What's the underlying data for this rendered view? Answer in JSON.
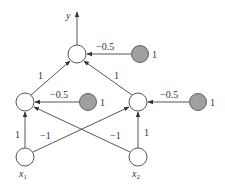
{
  "diagram": {
    "output_label": "y",
    "colors": {
      "node_fill": "#ffffff",
      "bias_fill": "#a0a0a0",
      "stroke": "#444444"
    },
    "nodes": {
      "output": {
        "x": 77,
        "y": 54
      },
      "hidden_left": {
        "x": 25,
        "y": 102
      },
      "hidden_right": {
        "x": 138,
        "y": 102
      },
      "input_x1": {
        "x": 25,
        "y": 157,
        "label": "x",
        "sub": "1"
      },
      "input_x2": {
        "x": 138,
        "y": 157,
        "label": "x",
        "sub": "2"
      },
      "bias_output": {
        "x": 140,
        "y": 54,
        "label": "1"
      },
      "bias_hidden_left": {
        "x": 88,
        "y": 102,
        "label": "1"
      },
      "bias_hidden_right": {
        "x": 198,
        "y": 102,
        "label": "1"
      }
    },
    "weights": {
      "hl_to_out": "1",
      "hr_to_out": "1",
      "bias_out": "−0.5",
      "bias_hl": "−0.5",
      "bias_hr": "−0.5",
      "x1_to_hl": "1",
      "x1_to_hr": "−1",
      "x2_to_hl": "−1",
      "x2_to_hr": "1"
    }
  }
}
